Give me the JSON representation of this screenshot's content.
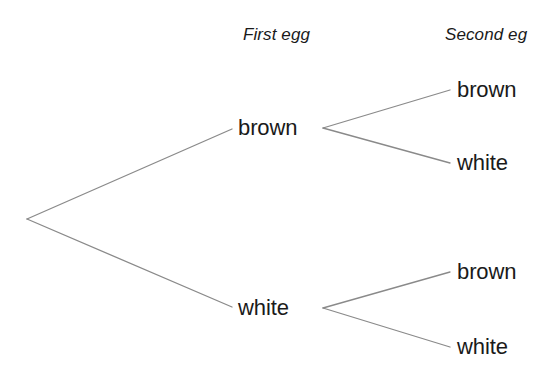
{
  "diagram": {
    "type": "probability-tree",
    "background_color": "#ffffff",
    "line_color": "#8a8a8a",
    "text_color": "#1a1a1a",
    "columns": [
      {
        "id": "first-egg",
        "label": "First egg"
      },
      {
        "id": "second-egg",
        "label": "Second eg",
        "clipped_at_image_edge": true
      }
    ],
    "nodes": {
      "root": {
        "id": "root",
        "label": "",
        "x": 27,
        "y": 219
      },
      "level1": [
        {
          "id": "l1-brown",
          "label": "brown",
          "x": 232,
          "y": 128
        },
        {
          "id": "l1-white",
          "label": "white",
          "x": 232,
          "y": 307
        }
      ],
      "level2": [
        {
          "id": "l2-brown-brown",
          "parent": "l1-brown",
          "label": "brown",
          "x": 450,
          "y": 90
        },
        {
          "id": "l2-brown-white",
          "parent": "l1-brown",
          "label": "white",
          "x": 450,
          "y": 163
        },
        {
          "id": "l2-white-brown",
          "parent": "l1-white",
          "label": "brown",
          "x": 450,
          "y": 272
        },
        {
          "id": "l2-white-white",
          "parent": "l1-white",
          "label": "white",
          "x": 450,
          "y": 347
        }
      ]
    },
    "branches": [
      {
        "id": "branch-root-brown",
        "from": [
          27,
          219
        ],
        "to": [
          232,
          129
        ]
      },
      {
        "id": "branch-root-white",
        "from": [
          27,
          219
        ],
        "to": [
          232,
          307
        ]
      },
      {
        "id": "branch-brown-brown",
        "from": [
          323,
          128
        ],
        "to": [
          450,
          90
        ]
      },
      {
        "id": "branch-brown-white",
        "from": [
          323,
          128
        ],
        "to": [
          450,
          163
        ]
      },
      {
        "id": "branch-white-brown",
        "from": [
          323,
          308
        ],
        "to": [
          450,
          272
        ]
      },
      {
        "id": "branch-white-white",
        "from": [
          323,
          308
        ],
        "to": [
          450,
          347
        ]
      }
    ]
  }
}
